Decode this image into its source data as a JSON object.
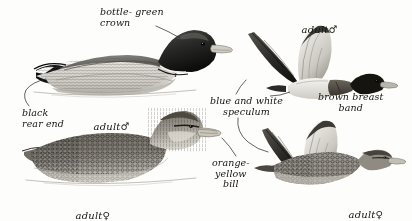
{
  "plate": {
    "title": "Gadwall plumage plate",
    "background_color": "#fdfdfb",
    "ink_color": "#15130f",
    "width": 412,
    "height": 221
  },
  "annotations": [
    {
      "id": "bottle-green-crown",
      "text": "bottle- green\ncrown",
      "x": 100,
      "y": 7,
      "align": "left",
      "points_to": "swimming-male-head"
    },
    {
      "id": "black-rear-end",
      "text": "black\nrear end",
      "x": 22,
      "y": 108,
      "align": "left",
      "points_to": "swimming-male-tail"
    },
    {
      "id": "blue-and-white-speculum",
      "text": "blue and white\nspeculum",
      "x": 210,
      "y": 96,
      "align": "center",
      "points_to": "flying-female-wing"
    },
    {
      "id": "orange-yellow-bill",
      "text": "orange-\nyellow\nbill",
      "x": 212,
      "y": 158,
      "align": "center",
      "points_to": "swimming-female-bill"
    },
    {
      "id": "brown-breast-band",
      "text": "brown breast\nband",
      "x": 318,
      "y": 92,
      "align": "center",
      "points_to": "flying-male-breast"
    }
  ],
  "captions": [
    {
      "id": "swimming-male-caption",
      "label": "adult",
      "symbol": "♂",
      "x": 80,
      "y": 110
    },
    {
      "id": "swimming-female-caption",
      "label": "adult",
      "symbol": "♀",
      "x": 62,
      "y": 199
    },
    {
      "id": "flying-male-caption",
      "label": "adult",
      "symbol": "♂",
      "x": 288,
      "y": 13
    },
    {
      "id": "flying-female-caption",
      "label": "adult",
      "symbol": "♀",
      "x": 335,
      "y": 198
    }
  ],
  "figures": [
    {
      "id": "swimming-adult-male",
      "name": "swimming-adult-male-duck",
      "pose": "swimming",
      "sex": "male",
      "features": [
        "bottle-green crown",
        "black rear end",
        "grey vermiculated flanks"
      ]
    },
    {
      "id": "swimming-adult-female",
      "name": "swimming-adult-female-duck",
      "pose": "swimming",
      "sex": "female",
      "features": [
        "orange-yellow bill",
        "mottled brown body",
        "dark eye stripe"
      ]
    },
    {
      "id": "flying-adult-male",
      "name": "flying-adult-male-duck",
      "pose": "flying",
      "sex": "male",
      "features": [
        "brown breast band",
        "white belly",
        "dark head"
      ]
    },
    {
      "id": "flying-adult-female",
      "name": "flying-adult-female-duck",
      "pose": "flying",
      "sex": "female",
      "features": [
        "blue and white speculum",
        "mottled brown upperparts"
      ]
    }
  ]
}
